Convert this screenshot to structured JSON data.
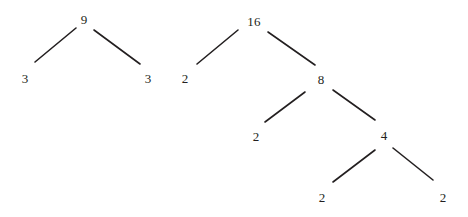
{
  "figure": {
    "width": 468,
    "height": 217,
    "background_color": "#ffffff",
    "ink_color": "#231f20",
    "edge_color": "#231f20",
    "edge_width": 1.6
  },
  "trees": [
    {
      "id": "tree-left",
      "root_value": "9",
      "nodes": [
        {
          "id": "left-root-9",
          "label": "9",
          "x": 84,
          "y": 19
        },
        {
          "id": "left-leaf-3-a",
          "label": "3",
          "x": 25,
          "y": 78
        },
        {
          "id": "left-leaf-3-b",
          "label": "3",
          "x": 148,
          "y": 78
        }
      ],
      "edges": [
        {
          "id": "left-edge-9-3a",
          "from": "left-root-9",
          "to": "left-leaf-3-a",
          "x1": 76,
          "y1": 28,
          "x2": 35,
          "y2": 62
        },
        {
          "id": "left-edge-9-3b",
          "from": "left-root-9",
          "to": "left-leaf-3-b",
          "x1": 94,
          "y1": 30,
          "x2": 140,
          "y2": 64
        }
      ]
    },
    {
      "id": "tree-right",
      "root_value": "16",
      "nodes": [
        {
          "id": "right-root-16",
          "label": "16",
          "x": 254,
          "y": 21
        },
        {
          "id": "right-leaf-2-a",
          "label": "2",
          "x": 185,
          "y": 78
        },
        {
          "id": "right-node-8",
          "label": "8",
          "x": 321,
          "y": 79
        },
        {
          "id": "right-leaf-2-b",
          "label": "2",
          "x": 256,
          "y": 136
        },
        {
          "id": "right-node-4",
          "label": "4",
          "x": 384,
          "y": 135
        },
        {
          "id": "right-leaf-2-c",
          "label": "2",
          "x": 322,
          "y": 197
        },
        {
          "id": "right-leaf-2-d",
          "label": "2",
          "x": 443,
          "y": 197
        }
      ],
      "edges": [
        {
          "id": "right-edge-16-2a",
          "from": "right-root-16",
          "to": "right-leaf-2-a",
          "x1": 238,
          "y1": 30,
          "x2": 197,
          "y2": 64
        },
        {
          "id": "right-edge-16-8",
          "from": "right-root-16",
          "to": "right-node-8",
          "x1": 268,
          "y1": 32,
          "x2": 315,
          "y2": 65
        },
        {
          "id": "right-edge-8-2b",
          "from": "right-node-8",
          "to": "right-leaf-2-b",
          "x1": 305,
          "y1": 92,
          "x2": 265,
          "y2": 122
        },
        {
          "id": "right-edge-8-4",
          "from": "right-node-8",
          "to": "right-node-4",
          "x1": 333,
          "y1": 90,
          "x2": 375,
          "y2": 120
        },
        {
          "id": "right-edge-4-2c",
          "from": "right-node-4",
          "to": "right-leaf-2-c",
          "x1": 375,
          "y1": 150,
          "x2": 333,
          "y2": 182
        },
        {
          "id": "right-edge-4-2d",
          "from": "right-node-4",
          "to": "right-leaf-2-d",
          "x1": 393,
          "y1": 148,
          "x2": 433,
          "y2": 180
        }
      ]
    }
  ]
}
